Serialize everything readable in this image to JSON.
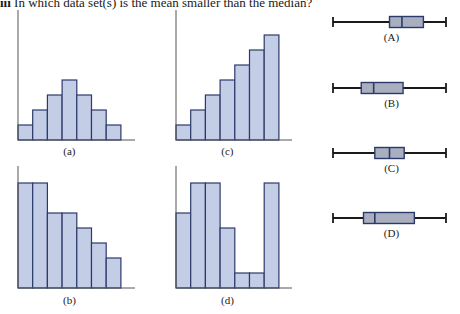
{
  "question": {
    "number": "iii",
    "text": "In which data set(s) is the mean smaller than the median?"
  },
  "colors": {
    "bar_fill": "#c4cde6",
    "bar_stroke": "#2b3a6b",
    "axis": "#555555",
    "box_fill": "#a9afbe",
    "box_stroke": "#2b3a6b",
    "whisker": "#1a1a1a"
  },
  "chart_data": [
    {
      "type": "bar",
      "title": "(a)",
      "categories": [
        "1",
        "2",
        "3",
        "4",
        "5",
        "6",
        "7"
      ],
      "values": [
        1,
        2,
        3,
        4,
        3,
        2,
        1
      ],
      "xlabel": "",
      "ylabel": "",
      "ylim": [
        0,
        8
      ],
      "grid": false,
      "shape": "symmetric, unimodal"
    },
    {
      "type": "bar",
      "title": "(b)",
      "categories": [
        "1",
        "2",
        "3",
        "4",
        "5",
        "6",
        "7"
      ],
      "values": [
        7,
        7,
        5,
        5,
        4,
        3,
        2
      ],
      "xlabel": "",
      "ylabel": "",
      "ylim": [
        0,
        8
      ],
      "grid": false,
      "shape": "right-skewed"
    },
    {
      "type": "bar",
      "title": "(c)",
      "categories": [
        "1",
        "2",
        "3",
        "4",
        "5",
        "6",
        "7"
      ],
      "values": [
        1,
        2,
        3,
        4,
        5,
        6,
        7
      ],
      "xlabel": "",
      "ylabel": "",
      "ylim": [
        0,
        8
      ],
      "grid": false,
      "shape": "left-skewed"
    },
    {
      "type": "bar",
      "title": "(d)",
      "categories": [
        "1",
        "2",
        "3",
        "4",
        "5",
        "6",
        "7"
      ],
      "values": [
        5,
        7,
        7,
        4,
        1,
        1,
        7
      ],
      "xlabel": "",
      "ylabel": "",
      "ylim": [
        0,
        8
      ],
      "grid": false,
      "shape": "bimodal"
    },
    {
      "type": "boxplot",
      "title": "(A)",
      "whisker_low": 0,
      "q1": 0.5,
      "median": 0.61,
      "q3": 0.8,
      "whisker_high": 1.0
    },
    {
      "type": "boxplot",
      "title": "(B)",
      "whisker_low": 0,
      "q1": 0.25,
      "median": 0.36,
      "q3": 0.62,
      "whisker_high": 1.0
    },
    {
      "type": "boxplot",
      "title": "(C)",
      "whisker_low": 0,
      "q1": 0.37,
      "median": 0.5,
      "q3": 0.63,
      "whisker_high": 1.0
    },
    {
      "type": "boxplot",
      "title": "(D)",
      "whisker_low": 0,
      "q1": 0.27,
      "median": 0.37,
      "q3": 0.72,
      "whisker_high": 1.0
    }
  ]
}
